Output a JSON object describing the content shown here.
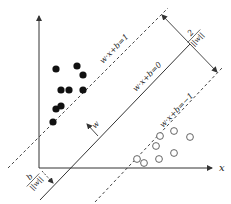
{
  "diagram": {
    "axes": {
      "x_label": "x",
      "origin": [
        39,
        168
      ],
      "y_top": [
        39,
        14
      ],
      "x_right": [
        213,
        168
      ]
    },
    "hyperplane": {
      "label": "w·x+b=0",
      "p1": [
        40,
        200
      ],
      "p2": [
        190,
        44
      ]
    },
    "margin_positive": {
      "label": "w·x+b=1",
      "p1": [
        8,
        168
      ],
      "p2": [
        168,
        8
      ]
    },
    "margin_negative": {
      "label": "w·x+b=−1",
      "p1": [
        95,
        202
      ],
      "p2": [
        222,
        68
      ]
    },
    "normal_vector": {
      "label": "w",
      "from": [
        98,
        136
      ],
      "to": [
        86,
        123
      ]
    },
    "margin_width": {
      "numerator": "2",
      "denominator": "||w||",
      "from": [
        161,
        14
      ],
      "to": [
        218,
        73
      ]
    },
    "offset": {
      "numerator": "b",
      "denominator": "||w||",
      "from": [
        41,
        170
      ],
      "to": [
        53,
        183
      ]
    },
    "class_positive_points": [
      [
        56,
        69
      ],
      [
        77,
        66
      ],
      [
        83,
        75
      ],
      [
        61,
        90
      ],
      [
        69,
        90
      ],
      [
        83,
        90
      ],
      [
        56,
        109
      ],
      [
        61,
        106
      ],
      [
        53,
        122
      ]
    ],
    "class_negative_points": [
      [
        160,
        136
      ],
      [
        174,
        131
      ],
      [
        190,
        137
      ],
      [
        156,
        146
      ],
      [
        174,
        153
      ],
      [
        137,
        159
      ],
      [
        144,
        163
      ],
      [
        159,
        159
      ]
    ],
    "colors": {
      "line": "#333333",
      "filled_point": "#111111",
      "open_point": "#555555"
    }
  }
}
